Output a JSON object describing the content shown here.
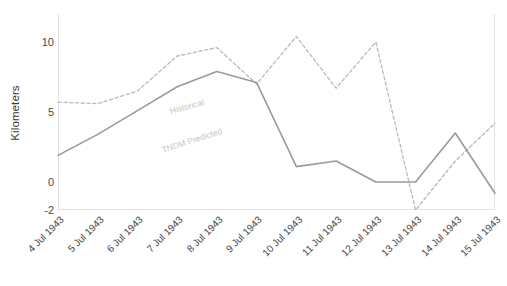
{
  "chart_data": {
    "type": "line",
    "title": "",
    "xlabel": "",
    "ylabel": "Kilometers",
    "ylim": [
      -2,
      12
    ],
    "yticks": [
      10,
      5,
      0,
      -2
    ],
    "grid": false,
    "legend_position": "inline",
    "categories": [
      "4 Jul 1943",
      "5 Jul 1943",
      "6 Jul 1943",
      "7 Jul 1943",
      "8 Jul 1943",
      "9 Jul 1943",
      "10 Jul 1943",
      "11 Jul 1943",
      "12 Jul 1943",
      "13 Jul 1943",
      "14 Jul 1943",
      "15 Jul 1943"
    ],
    "series": [
      {
        "name": "Historical",
        "style": "dashed",
        "color": "#b9b9b9",
        "values": [
          5.7,
          5.6,
          6.5,
          9.0,
          9.6,
          7.0,
          10.4,
          6.7,
          10.0,
          -2.0,
          1.5,
          4.2
        ]
      },
      {
        "name": "TNDM Predicted",
        "style": "solid",
        "color": "#9a9a9a",
        "values": [
          1.9,
          3.4,
          5.1,
          6.8,
          7.9,
          7.1,
          1.1,
          1.5,
          0.0,
          0.0,
          3.5,
          -0.8
        ]
      }
    ]
  },
  "axis": {
    "y_label": "Kilometers",
    "y_ticks": [
      "10",
      "5",
      "0",
      "-2"
    ],
    "x_ticks": [
      "4 Jul 1943",
      "5 Jul 1943",
      "6 Jul 1943",
      "7 Jul 1943",
      "8 Jul 1943",
      "9 Jul 1943",
      "10 Jul 1943",
      "11 Jul 1943",
      "12 Jul 1943",
      "13 Jul 1943",
      "14 Jul 1943",
      "15 Jul 1943"
    ]
  },
  "inline_labels": {
    "historical": "Historical",
    "tndm": "TNDM Predicted"
  },
  "colors": {
    "historical_line": "#b9b9b9",
    "tndm_line": "#9a9a9a",
    "axis_border": "#e2e2e2",
    "tick_text": "#484848",
    "background": "#ffffff"
  }
}
